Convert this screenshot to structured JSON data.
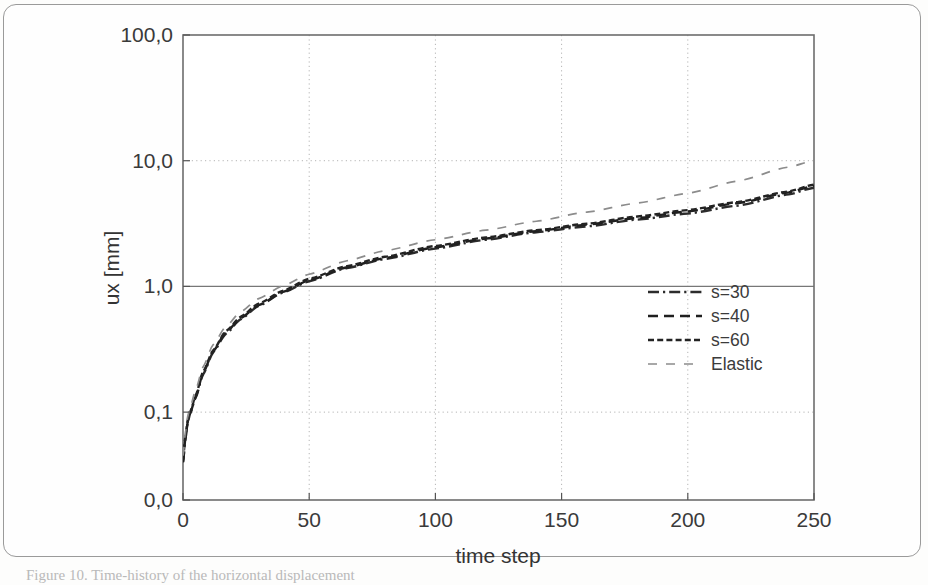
{
  "figure": {
    "kind": "scanned-figure",
    "caption_fragment": "Figure 10. Time-history of the horizontal displacement",
    "frame_color": "#9a9a9a",
    "page_background": "#fefefe"
  },
  "chart_data": {
    "type": "line",
    "title": "",
    "subtitle": "",
    "xlabel": "time step",
    "ylabel": "ux [mm]",
    "yscale": "log",
    "xscale": "linear",
    "xlim": [
      0,
      250
    ],
    "ylim": [
      0.02,
      100.0
    ],
    "grid": "dotted-both-axes",
    "legend_position": "inside-right-middle",
    "x_ticks": [
      0,
      50,
      100,
      150,
      200,
      250
    ],
    "x_tick_labels": [
      "0",
      "50",
      "100",
      "150",
      "200",
      "250"
    ],
    "y_ticks": [
      0.02,
      0.1,
      1.0,
      10.0,
      100.0
    ],
    "y_tick_labels": [
      "0,0",
      "0,1",
      "1,0",
      "10,0",
      "100,0"
    ],
    "decimal_separator": "comma",
    "series": [
      {
        "name": "s=30",
        "style": "dash-dot",
        "color": "#2c2c2c",
        "x": [
          0,
          1,
          2,
          3,
          5,
          8,
          12,
          17,
          23,
          30,
          40,
          50,
          65,
          80,
          100,
          120,
          140,
          160,
          180,
          200,
          220,
          240,
          250
        ],
        "values": [
          0.04,
          0.062,
          0.085,
          0.1,
          0.13,
          0.2,
          0.3,
          0.42,
          0.55,
          0.7,
          0.9,
          1.1,
          1.4,
          1.65,
          2.0,
          2.35,
          2.7,
          3.0,
          3.4,
          3.8,
          4.4,
          5.4,
          6.1
        ]
      },
      {
        "name": "s=40",
        "style": "dashed",
        "color": "#1f1f1f",
        "x": [
          0,
          1,
          2,
          3,
          5,
          8,
          12,
          17,
          23,
          30,
          40,
          50,
          65,
          80,
          100,
          120,
          140,
          160,
          180,
          200,
          220,
          240,
          250
        ],
        "values": [
          0.04,
          0.063,
          0.086,
          0.1,
          0.132,
          0.205,
          0.305,
          0.43,
          0.56,
          0.71,
          0.91,
          1.12,
          1.42,
          1.68,
          2.05,
          2.4,
          2.75,
          3.1,
          3.5,
          3.95,
          4.6,
          5.6,
          6.3
        ]
      },
      {
        "name": "s=60",
        "style": "fine-dashed",
        "color": "#232323",
        "x": [
          0,
          1,
          2,
          3,
          5,
          8,
          12,
          17,
          23,
          30,
          40,
          50,
          65,
          80,
          100,
          120,
          140,
          160,
          180,
          200,
          220,
          240,
          250
        ],
        "values": [
          0.042,
          0.065,
          0.088,
          0.102,
          0.135,
          0.21,
          0.31,
          0.44,
          0.575,
          0.73,
          0.93,
          1.15,
          1.45,
          1.72,
          2.1,
          2.45,
          2.8,
          3.15,
          3.6,
          4.05,
          4.7,
          5.7,
          6.45
        ]
      },
      {
        "name": "Elastic",
        "style": "sparse-dash-light",
        "color": "#8c8c8c",
        "x": [
          0,
          1,
          2,
          3,
          5,
          8,
          12,
          17,
          23,
          30,
          40,
          50,
          65,
          80,
          100,
          120,
          140,
          160,
          180,
          200,
          220,
          240,
          250
        ],
        "values": [
          0.045,
          0.07,
          0.095,
          0.112,
          0.15,
          0.23,
          0.345,
          0.48,
          0.63,
          0.8,
          1.02,
          1.25,
          1.6,
          1.92,
          2.35,
          2.8,
          3.3,
          3.9,
          4.6,
          5.5,
          6.9,
          8.9,
          10.0
        ]
      }
    ],
    "legend_entries": [
      {
        "label": "s=30",
        "style": "dash-dot",
        "color": "#2c2c2c"
      },
      {
        "label": "s=40",
        "style": "dashed",
        "color": "#1f1f1f"
      },
      {
        "label": "s=60",
        "style": "fine-dashed",
        "color": "#232323"
      },
      {
        "label": "Elastic",
        "style": "sparse-dash-light",
        "color": "#8c8c8c"
      }
    ]
  }
}
